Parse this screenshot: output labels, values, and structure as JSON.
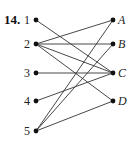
{
  "problem_number": "14.",
  "left_nodes": [
    {
      "id": "1",
      "label": "1",
      "x": 36,
      "y": 20
    },
    {
      "id": "2",
      "label": "2",
      "x": 36,
      "y": 44
    },
    {
      "id": "3",
      "label": "3",
      "x": 36,
      "y": 73
    },
    {
      "id": "4",
      "label": "4",
      "x": 36,
      "y": 101
    },
    {
      "id": "5",
      "label": "5",
      "x": 36,
      "y": 131
    }
  ],
  "right_nodes": [
    {
      "id": "A",
      "label": "A",
      "x": 113,
      "y": 20
    },
    {
      "id": "B",
      "label": "B",
      "x": 113,
      "y": 44
    },
    {
      "id": "C",
      "label": "C",
      "x": 113,
      "y": 73
    },
    {
      "id": "D",
      "label": "D",
      "x": 113,
      "y": 101
    }
  ],
  "edges": [
    [
      "1",
      "C"
    ],
    [
      "2",
      "A"
    ],
    [
      "2",
      "B"
    ],
    [
      "2",
      "C"
    ],
    [
      "2",
      "D"
    ],
    [
      "3",
      "C"
    ],
    [
      "4",
      "C"
    ],
    [
      "5",
      "A"
    ],
    [
      "5",
      "B"
    ],
    [
      "5",
      "D"
    ]
  ],
  "colors": {
    "line": "#333333",
    "dot": "#111111"
  }
}
